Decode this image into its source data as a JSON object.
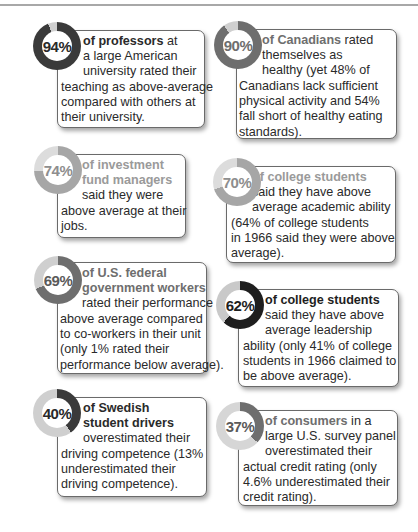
{
  "cards": [
    {
      "percent_label": "94%",
      "percent_value": 94,
      "ring_color": "#3a3a3a",
      "track_color": "#cfcfcf",
      "label_color": "#2a2a2a",
      "headline_color": "#2a2a2a",
      "headline": "of professors",
      "lines": [
        " at",
        "a large American",
        "university rated their",
        "teaching as above-average",
        "compared with others at",
        "their university."
      ]
    },
    {
      "percent_label": "90%",
      "percent_value": 90,
      "ring_color": "#6e6e6e",
      "track_color": "#cfcfcf",
      "label_color": "#6e6e6e",
      "headline_color": "#6e6e6e",
      "headline": "of Canadians",
      "lines": [
        " rated",
        "themselves as",
        "healthy (yet 48% of",
        "Canadians lack sufficient",
        "physical activity and 54%",
        "fall short of healthy eating",
        "standards)."
      ]
    },
    {
      "percent_label": "74%",
      "percent_value": 74,
      "ring_color": "#a6a6a6",
      "track_color": "#dcdcdc",
      "label_color": "#8e8e8e",
      "headline_color": "#9a9a9a",
      "headline": "of investment",
      "lines": [
        "fund managers",
        "said they were",
        "above average at their",
        "jobs."
      ]
    },
    {
      "percent_label": "70%",
      "percent_value": 70,
      "ring_color": "#a6a6a6",
      "track_color": "#dcdcdc",
      "label_color": "#8e8e8e",
      "headline_color": "#9a9a9a",
      "headline": "of college students",
      "lines": [
        "said they have above",
        "average academic ability",
        "(64% of college students",
        "in 1966 said they were above",
        "average)."
      ]
    },
    {
      "percent_label": "69%",
      "percent_value": 69,
      "ring_color": "#6e6e6e",
      "track_color": "#cfcfcf",
      "label_color": "#5a5a5a",
      "headline_color": "#6e6e6e",
      "headline": "of U.S. federal",
      "lines": [
        "government workers",
        "rated their performance",
        "above average compared",
        "to co-workers in their unit",
        "(only 1% rated their",
        "performance below average)."
      ]
    },
    {
      "percent_label": "62%",
      "percent_value": 62,
      "ring_color": "#1e1e1e",
      "track_color": "#c9c9c9",
      "label_color": "#1e1e1e",
      "headline_color": "#1e1e1e",
      "headline": "of college students",
      "lines": [
        "said they have above",
        "average leadership",
        "ability (only 41% of college",
        "students in 1966 claimed to",
        "be above average)."
      ]
    },
    {
      "percent_label": "40%",
      "percent_value": 40,
      "ring_color": "#3a3a3a",
      "track_color": "#cfcfcf",
      "label_color": "#2a2a2a",
      "headline_color": "#2a2a2a",
      "headline": "of Swedish",
      "lines": [
        "student drivers",
        "overestimated their",
        "driving competence (13%",
        "underestimated their",
        "driving competence)."
      ]
    },
    {
      "percent_label": "37%",
      "percent_value": 37,
      "ring_color": "#6e6e6e",
      "track_color": "#d6d6d6",
      "label_color": "#5a5a5a",
      "headline_color": "#6e6e6e",
      "headline": "of consumers",
      "lines": [
        " in a",
        "large U.S. survey panel",
        "overestimated their",
        "actual credit rating (only",
        "4.6% underestimated their",
        "credit rating)."
      ]
    }
  ]
}
